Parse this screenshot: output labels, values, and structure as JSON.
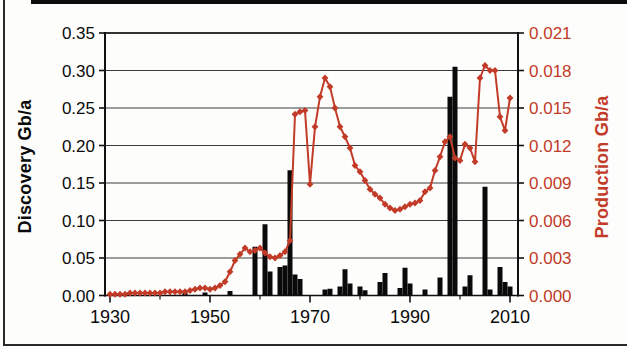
{
  "figure": {
    "colors": {
      "production_accent": "#c23b28",
      "discovery_bar": "#0a0a0a",
      "grid_line": "#3c3c3c",
      "axis_frame": "#111111",
      "background": "#fdfdfc"
    }
  },
  "chart_data": {
    "type": "combo (bar + line, dual y-axis)",
    "title": "",
    "grid": "horizontal gridlines on",
    "legend_position": "none",
    "x_axis": {
      "label": "",
      "range": [
        1929,
        2012
      ],
      "labeled_ticks": [
        1930,
        1950,
        1970,
        1990,
        2010
      ],
      "minor_ticks": [
        1940,
        1960,
        1980,
        2000
      ]
    },
    "left_axis": {
      "title": "Discovery Gb/a",
      "range": [
        0,
        0.35
      ],
      "ticks": [
        0.0,
        0.05,
        0.1,
        0.15,
        0.2,
        0.25,
        0.3,
        0.35
      ],
      "decimals": 2,
      "color": "#0a0a0a"
    },
    "right_axis": {
      "title": "Production Gb/a",
      "range": [
        0,
        0.021
      ],
      "ticks": [
        0.0,
        0.003,
        0.006,
        0.009,
        0.012,
        0.015,
        0.018,
        0.021
      ],
      "decimals": 3,
      "color": "#c23b28"
    },
    "series": [
      {
        "name": "Discovery Gb/a",
        "type": "bar",
        "axis": "left",
        "color": "#0a0a0a",
        "points": {
          "1945": 0.004,
          "1949": 0.004,
          "1954": 0.006,
          "1959": 0.065,
          "1961": 0.095,
          "1962": 0.032,
          "1964": 0.038,
          "1965": 0.04,
          "1966": 0.167,
          "1967": 0.028,
          "1968": 0.022,
          "1973": 0.008,
          "1974": 0.009,
          "1976": 0.012,
          "1977": 0.035,
          "1978": 0.016,
          "1980": 0.012,
          "1981": 0.007,
          "1984": 0.018,
          "1985": 0.03,
          "1988": 0.01,
          "1989": 0.037,
          "1990": 0.016,
          "1993": 0.008,
          "1996": 0.024,
          "1998": 0.265,
          "1999": 0.305,
          "2001": 0.012,
          "2002": 0.027,
          "2005": 0.145,
          "2006": 0.008,
          "2008": 0.038,
          "2009": 0.018,
          "2010": 0.012
        }
      },
      {
        "name": "Production Gb/a",
        "type": "line",
        "axis": "right",
        "color": "#c23b28",
        "marker": "diamond",
        "x_start": 1930,
        "values": [
          0.0001,
          0.0001,
          0.0001,
          0.0001,
          0.0002,
          0.0002,
          0.0002,
          0.0002,
          0.0002,
          0.0002,
          0.0002,
          0.0003,
          0.0003,
          0.0003,
          0.0003,
          0.0003,
          0.0004,
          0.0005,
          0.0006,
          0.0006,
          0.0005,
          0.0006,
          0.0008,
          0.0011,
          0.0019,
          0.0028,
          0.0033,
          0.0038,
          0.0035,
          0.0036,
          0.0038,
          0.0034,
          0.0031,
          0.003,
          0.0032,
          0.0035,
          0.0044,
          0.0145,
          0.0147,
          0.0148,
          0.0089,
          0.0135,
          0.0159,
          0.0174,
          0.0167,
          0.015,
          0.0135,
          0.0127,
          0.0118,
          0.0104,
          0.0099,
          0.0092,
          0.0085,
          0.0081,
          0.0078,
          0.0073,
          0.007,
          0.0068,
          0.0069,
          0.0071,
          0.0073,
          0.0074,
          0.0076,
          0.0083,
          0.0086,
          0.01,
          0.0111,
          0.0123,
          0.0127,
          0.011,
          0.0108,
          0.0121,
          0.0118,
          0.0107,
          0.0174,
          0.0184,
          0.018,
          0.018,
          0.0143,
          0.0132,
          0.0158
        ]
      }
    ]
  }
}
